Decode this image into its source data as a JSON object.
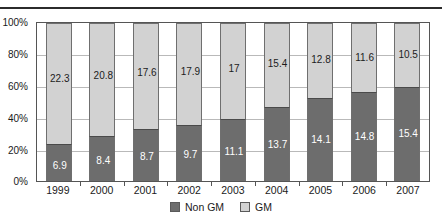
{
  "caption_fragment": "",
  "axis": {
    "y_ticks": [
      "100%",
      "80%",
      "60%",
      "40%",
      "20%",
      "0%"
    ]
  },
  "legend": {
    "items": [
      {
        "label": "Non GM",
        "color": "#6d6d6d"
      },
      {
        "label": "GM",
        "color": "#d2d2d2"
      }
    ]
  },
  "chart_data": {
    "type": "bar",
    "stacked": true,
    "stacked_normalized": true,
    "title": "",
    "xlabel": "",
    "ylabel": "",
    "ylim": [
      0,
      100
    ],
    "ytick_labels": [
      "0%",
      "20%",
      "40%",
      "60%",
      "80%",
      "100%"
    ],
    "grid": true,
    "legend_position": "bottom-center",
    "categories": [
      "1999",
      "2000",
      "2001",
      "2002",
      "2003",
      "2004",
      "2005",
      "2006",
      "2007"
    ],
    "series": [
      {
        "name": "Non GM",
        "color": "#6d6d6d",
        "values": [
          6.9,
          8.4,
          8.7,
          9.7,
          11.1,
          13.7,
          14.1,
          14.8,
          15.4
        ],
        "labels": [
          "6.9",
          "8.4",
          "8.7",
          "9.7",
          "11.1",
          "13.7",
          "14.1",
          "14.8",
          "15.4"
        ]
      },
      {
        "name": "GM",
        "color": "#d2d2d2",
        "values": [
          22.3,
          20.8,
          17.6,
          17.9,
          17,
          15.4,
          12.8,
          11.6,
          10.5
        ],
        "labels": [
          "22.3",
          "20.8",
          "17.6",
          "17.9",
          "17",
          "15.4",
          "12.8",
          "11.6",
          "10.5"
        ]
      }
    ],
    "bars": [
      {
        "category": "1999",
        "non_gm": 6.9,
        "gm": 22.3,
        "total": 29.2
      },
      {
        "category": "2000",
        "non_gm": 8.4,
        "gm": 20.8,
        "total": 29.2
      },
      {
        "category": "2001",
        "non_gm": 8.7,
        "gm": 17.6,
        "total": 26.3
      },
      {
        "category": "2002",
        "non_gm": 9.7,
        "gm": 17.9,
        "total": 27.6
      },
      {
        "category": "2003",
        "non_gm": 11.1,
        "gm": 17.0,
        "total": 28.1
      },
      {
        "category": "2004",
        "non_gm": 13.7,
        "gm": 15.4,
        "total": 29.1
      },
      {
        "category": "2005",
        "non_gm": 14.1,
        "gm": 12.8,
        "total": 26.9
      },
      {
        "category": "2006",
        "non_gm": 14.8,
        "gm": 11.6,
        "total": 26.4
      },
      {
        "category": "2007",
        "non_gm": 15.4,
        "gm": 10.5,
        "total": 25.9
      }
    ]
  }
}
